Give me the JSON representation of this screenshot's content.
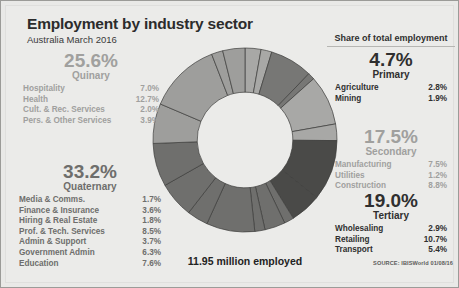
{
  "header": {
    "title": "Employment by industry sector",
    "subtitle": "Australia March 2016"
  },
  "right_header": "Share of total employment",
  "center_label": "11.95 million employed",
  "source": "SOURCE: IBISWorld 01/08/16",
  "groups": {
    "quinary": {
      "percent": "25.6%",
      "name": "Quinary",
      "items": [
        {
          "label": "Hospitality",
          "value": "7.0%"
        },
        {
          "label": "Health",
          "value": "12.7%"
        },
        {
          "label": "Cult. & Rec. Services",
          "value": "2.0%"
        },
        {
          "label": "Pers. & Other Services",
          "value": "3.9%"
        }
      ]
    },
    "quaternary": {
      "percent": "33.2%",
      "name": "Quaternary",
      "items": [
        {
          "label": "Media & Comms.",
          "value": "1.7%"
        },
        {
          "label": "Finance & Insurance",
          "value": "3.6%"
        },
        {
          "label": "Hiring & Real Estate",
          "value": "1.8%"
        },
        {
          "label": "Prof. & Tech. Services",
          "value": "8.5%"
        },
        {
          "label": "Admin & Support",
          "value": "3.7%"
        },
        {
          "label": "Government Admin",
          "value": "6.3%"
        },
        {
          "label": "Education",
          "value": "7.6%"
        }
      ]
    },
    "primary": {
      "percent": "4.7%",
      "name": "Primary",
      "items": [
        {
          "label": "Agriculture",
          "value": "2.8%"
        },
        {
          "label": "Mining",
          "value": "1.9%"
        }
      ]
    },
    "secondary": {
      "percent": "17.5%",
      "name": "Secondary",
      "items": [
        {
          "label": "Manufacturing",
          "value": "7.5%"
        },
        {
          "label": "Utilities",
          "value": "1.2%"
        },
        {
          "label": "Construction",
          "value": "8.8%"
        }
      ]
    },
    "tertiary": {
      "percent": "19.0%",
      "name": "Tertiary",
      "items": [
        {
          "label": "Wholesaling",
          "value": "2.9%"
        },
        {
          "label": "Retailing",
          "value": "10.7%"
        },
        {
          "label": "Transport",
          "value": "5.4%"
        }
      ]
    }
  },
  "chart_data": {
    "type": "pie",
    "title": "Employment by industry sector",
    "subtitle": "Australia March 2016",
    "donut": true,
    "inner_radius_ratio": 0.52,
    "start_angle_deg": -90,
    "direction": "clockwise",
    "total_label": "11.95 million employed",
    "units": "% share of total employment",
    "slices": [
      {
        "label": "Agriculture",
        "group": "Primary",
        "value": 2.8,
        "color": "#a8a8a6"
      },
      {
        "label": "Mining",
        "group": "Primary",
        "value": 1.9,
        "color": "#a8a8a6"
      },
      {
        "label": "Manufacturing",
        "group": "Secondary",
        "value": 7.5,
        "color": "#777775"
      },
      {
        "label": "Utilities",
        "group": "Secondary",
        "value": 1.2,
        "color": "#777775"
      },
      {
        "label": "Construction",
        "group": "Secondary",
        "value": 8.8,
        "color": "#a8a8a6"
      },
      {
        "label": "Wholesaling",
        "group": "Tertiary",
        "value": 2.9,
        "color": "#a8a8a6"
      },
      {
        "label": "Retailing",
        "group": "Tertiary",
        "value": 10.7,
        "color": "#4a4a48"
      },
      {
        "label": "Transport",
        "group": "Tertiary",
        "value": 5.4,
        "color": "#4a4a48"
      },
      {
        "label": "Media & Comms.",
        "group": "Quaternary",
        "value": 1.7,
        "color": "#6f6f6d"
      },
      {
        "label": "Finance & Insurance",
        "group": "Quaternary",
        "value": 3.6,
        "color": "#6f6f6d"
      },
      {
        "label": "Hiring & Real Estate",
        "group": "Quaternary",
        "value": 1.8,
        "color": "#6f6f6d"
      },
      {
        "label": "Prof. & Tech. Services",
        "group": "Quaternary",
        "value": 8.5,
        "color": "#6f6f6d"
      },
      {
        "label": "Admin & Support",
        "group": "Quaternary",
        "value": 3.7,
        "color": "#6f6f6d"
      },
      {
        "label": "Government Admin",
        "group": "Quaternary",
        "value": 6.3,
        "color": "#6f6f6d"
      },
      {
        "label": "Education",
        "group": "Quaternary",
        "value": 7.6,
        "color": "#6f6f6d"
      },
      {
        "label": "Hospitality",
        "group": "Quinary",
        "value": 7.0,
        "color": "#9e9e9c"
      },
      {
        "label": "Health",
        "group": "Quinary",
        "value": 12.7,
        "color": "#9e9e9c"
      },
      {
        "label": "Cult. & Rec. Services",
        "group": "Quinary",
        "value": 2.0,
        "color": "#9e9e9c"
      },
      {
        "label": "Pers. & Other Services",
        "group": "Quinary",
        "value": 3.9,
        "color": "#9e9e9c"
      }
    ]
  }
}
